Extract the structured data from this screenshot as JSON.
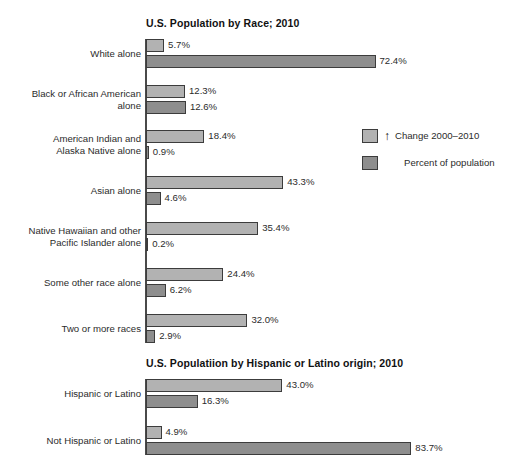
{
  "chart_data": [
    {
      "type": "bar",
      "orientation": "horizontal",
      "title": "U.S. Population by Race; 2010",
      "xlabel": "",
      "ylabel": "",
      "xlim": [
        0,
        90
      ],
      "grid": false,
      "legend_position": "right",
      "categories": [
        "White alone",
        "Black or African American\nalone",
        "American Indian and\nAlaska Native alone",
        "Asian alone",
        "Native Hawaiian and other\nPacific Islander alone",
        "Some other race alone",
        "Two or more races"
      ],
      "series": [
        {
          "name": "Change 2000–2010",
          "values": [
            5.7,
            12.3,
            18.4,
            43.3,
            35.4,
            24.4,
            32.0
          ],
          "labels": [
            "5.7%",
            "12.3%",
            "18.4%",
            "43.3%",
            "35.4%",
            "24.4%",
            "32.0%"
          ],
          "color": "#b2b2b2"
        },
        {
          "name": "Percent of population",
          "values": [
            72.4,
            12.6,
            0.9,
            4.6,
            0.2,
            6.2,
            2.9
          ],
          "labels": [
            "72.4%",
            "12.6%",
            "0.9%",
            "4.6%",
            "0.2%",
            "6.2%",
            "2.9%"
          ],
          "color": "#8e8e8e"
        }
      ]
    },
    {
      "type": "bar",
      "orientation": "horizontal",
      "title": "U.S. Populatiion by Hispanic or Latino origin; 2010",
      "xlabel": "",
      "ylabel": "",
      "xlim": [
        0,
        90
      ],
      "grid": false,
      "legend_position": "none",
      "categories": [
        "Hispanic or Latino",
        "Not Hispanic or Latino"
      ],
      "series": [
        {
          "name": "Change 2000–2010",
          "values": [
            43.0,
            4.9
          ],
          "labels": [
            "43.0%",
            "4.9%"
          ],
          "color": "#b2b2b2"
        },
        {
          "name": "Percent of population",
          "values": [
            16.3,
            83.7
          ],
          "labels": [
            "16.3%",
            "83.7%"
          ],
          "color": "#8e8e8e"
        }
      ]
    }
  ],
  "race_chart": {
    "title": "U.S. Population by Race; 2010",
    "rows": [
      {
        "label": "White alone",
        "change_value": "5.7%",
        "percent_value": "72.4%"
      },
      {
        "label": "Black or African American\nalone",
        "change_value": "12.3%",
        "percent_value": "12.6%"
      },
      {
        "label": "American Indian and\nAlaska Native alone",
        "change_value": "18.4%",
        "percent_value": "0.9%"
      },
      {
        "label": "Asian alone",
        "change_value": "43.3%",
        "percent_value": "4.6%"
      },
      {
        "label": "Native Hawaiian and other\nPacific Islander alone",
        "change_value": "35.4%",
        "percent_value": "0.2%"
      },
      {
        "label": "Some other race alone",
        "change_value": "24.4%",
        "percent_value": "6.2%"
      },
      {
        "label": "Two or more races",
        "change_value": "32.0%",
        "percent_value": "2.9%"
      }
    ]
  },
  "origin_chart": {
    "title": "U.S. Populatiion by Hispanic or Latino origin; 2010",
    "rows": [
      {
        "label": "Hispanic or Latino",
        "change_value": "43.0%",
        "percent_value": "16.3%"
      },
      {
        "label": "Not Hispanic or Latino",
        "change_value": "4.9%",
        "percent_value": "83.7%"
      }
    ]
  },
  "legend": {
    "change_label": "Change 2000–2010",
    "change_arrow": "↑",
    "percent_label": "Percent of population",
    "change_color": "#b2b2b2",
    "percent_color": "#8e8e8e"
  }
}
